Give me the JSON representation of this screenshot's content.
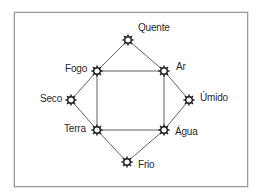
{
  "diagram": {
    "type": "elements-qualities-square",
    "frame_border_color": "#9a9a9a",
    "line_color": "#3a3a3a",
    "text_color": "#2a2a2a",
    "node_icon": "star-gear-icon",
    "nodes": {
      "quente": {
        "label": "Quente",
        "x": 128,
        "y": 40,
        "role": "quality"
      },
      "fogo": {
        "label": "Fogo",
        "x": 97,
        "y": 71,
        "role": "element"
      },
      "ar": {
        "label": "Ar",
        "x": 164,
        "y": 71,
        "role": "element"
      },
      "seco": {
        "label": "Seco",
        "x": 71,
        "y": 100,
        "role": "quality"
      },
      "umido": {
        "label": "Úmido",
        "x": 189,
        "y": 100,
        "role": "quality"
      },
      "terra": {
        "label": "Terra",
        "x": 97,
        "y": 130,
        "role": "element"
      },
      "agua": {
        "label": "Água",
        "x": 164,
        "y": 130,
        "role": "element"
      },
      "frio": {
        "label": "Frio",
        "x": 127,
        "y": 162,
        "role": "quality"
      }
    },
    "edges": [
      [
        "quente",
        "fogo"
      ],
      [
        "quente",
        "ar"
      ],
      [
        "fogo",
        "seco"
      ],
      [
        "ar",
        "umido"
      ],
      [
        "seco",
        "terra"
      ],
      [
        "umido",
        "agua"
      ],
      [
        "terra",
        "frio"
      ],
      [
        "agua",
        "frio"
      ],
      [
        "fogo",
        "ar"
      ],
      [
        "fogo",
        "terra"
      ],
      [
        "ar",
        "agua"
      ],
      [
        "terra",
        "agua"
      ]
    ]
  }
}
